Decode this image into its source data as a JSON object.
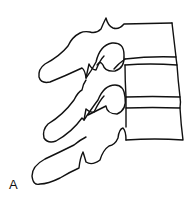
{
  "figure": {
    "panel_label": "A",
    "stroke_color": "#111111",
    "background_color": "#ffffff"
  }
}
